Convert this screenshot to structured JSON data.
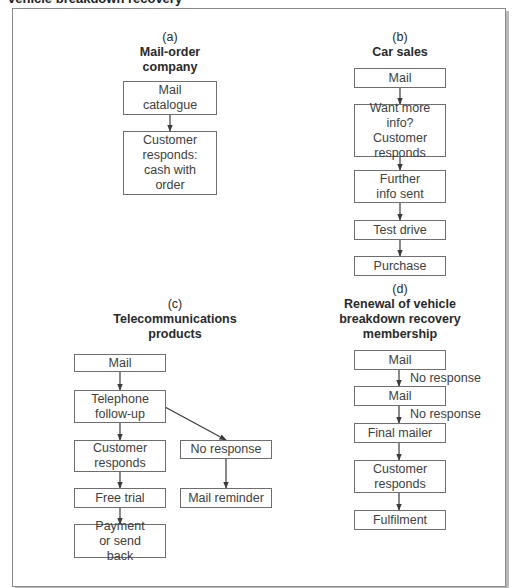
{
  "header": {
    "caption_cut": "vehicle breakdown recovery"
  },
  "panels": {
    "a": {
      "label": "(a)",
      "title_lines": [
        "Mail-order",
        "company"
      ],
      "steps": [
        {
          "text": "Mail catalogue"
        },
        {
          "text": "Customer responds: cash with order"
        }
      ]
    },
    "b": {
      "label": "(b)",
      "title_lines": [
        "Car sales"
      ],
      "steps": [
        {
          "text": "Mail"
        },
        {
          "text": "Want more info? Customer responds"
        },
        {
          "text": "Further info sent"
        },
        {
          "text": "Test drive"
        },
        {
          "text": "Purchase"
        }
      ]
    },
    "c": {
      "label": "(c)",
      "title_lines": [
        "Telecommunications",
        "products"
      ],
      "steps": [
        {
          "text": "Mail"
        },
        {
          "text": "Telephone follow-up"
        },
        {
          "text": "Customer responds"
        },
        {
          "text": "Free trial"
        },
        {
          "text": "Payment or send back"
        }
      ],
      "branch": [
        {
          "text": "No response"
        },
        {
          "text": "Mail reminder"
        }
      ]
    },
    "d": {
      "label": "(d)",
      "title_lines": [
        "Renewal of vehicle",
        "breakdown recovery",
        "membership"
      ],
      "steps": [
        {
          "text": "Mail"
        },
        {
          "text": "Mail"
        },
        {
          "text": "Final mailer"
        },
        {
          "text": "Customer responds"
        },
        {
          "text": "Fulfilment"
        }
      ],
      "edge_labels": [
        "No response",
        "No response"
      ]
    }
  },
  "colors": {
    "border": "#6e6e6e",
    "text": "#404040",
    "frame": "#8a8a8a",
    "shadow": "#b9b9b9"
  }
}
